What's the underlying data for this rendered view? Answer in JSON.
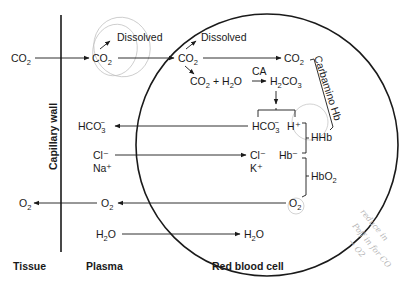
{
  "diagram": {
    "type": "CO2/O2 exchange between tissue, plasma, and red blood cell",
    "regions": {
      "tissue": "Tissue",
      "plasma": "Plasma",
      "rbc": "Red blood cell",
      "wall": "Capillary wall"
    },
    "tissue_side": {
      "co2": "CO",
      "o2": "O"
    },
    "plasma_side": {
      "co2": "CO",
      "dissolved": "Dissolved",
      "hco3": "HCO",
      "cl": "Cl⁻",
      "na": "Na⁺",
      "o2": "O",
      "h2o": "H",
      "h2o_tail": "O"
    },
    "rbc_side": {
      "co2": "CO",
      "dissolved": "Dissolved",
      "co2_top": "CO",
      "carbamino": "Carbamino Hb",
      "co2_react": "CO",
      "plus": "+",
      "h2o_react": "H",
      "h2o_react_tail": "O",
      "enzyme": "CA",
      "h2co3_a": "H",
      "h2co3_b": "CO",
      "hco3": "HCO",
      "h_plus": "H⁺",
      "hhb": "HHb",
      "hb_minus": "Hb⁻",
      "cl": "Cl⁻",
      "k": "K⁺",
      "hbo2": "HbO",
      "o2": "O",
      "h2o": "H",
      "h2o_tail": "O"
    },
    "subscripts": {
      "two": "2",
      "three": "3",
      "minus": "−"
    },
    "annotation_handwritten": [
      "reduce in",
      "Poff in for CO",
      "→ O2"
    ]
  }
}
